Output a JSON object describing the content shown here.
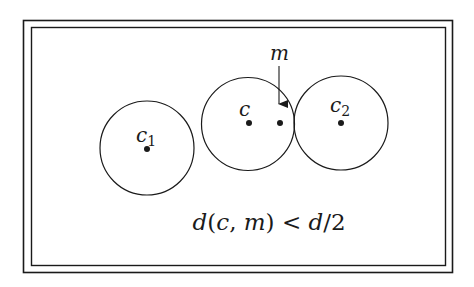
{
  "figure": {
    "type": "cluster-separation-diagram",
    "colors": {
      "stroke": "#1a1a1a",
      "background": "#ffffff"
    },
    "labels": {
      "c1": {
        "base": "c",
        "subscript": "1"
      },
      "c": {
        "base": "c",
        "subscript": ""
      },
      "c2": {
        "base": "c",
        "subscript": "2"
      },
      "m": {
        "base": "m"
      }
    },
    "points": [
      "c1",
      "c",
      "m",
      "c2"
    ],
    "circles": [
      "c1",
      "c",
      "c2"
    ],
    "arrow": {
      "from_label": "m",
      "to_point": "m"
    },
    "formula": {
      "italic_d1": "d",
      "open": "(",
      "arg1": "c",
      "comma": ", ",
      "arg2": "m",
      "close": ")",
      "relation": " < ",
      "italic_d2": "d",
      "rest": "/2"
    }
  }
}
